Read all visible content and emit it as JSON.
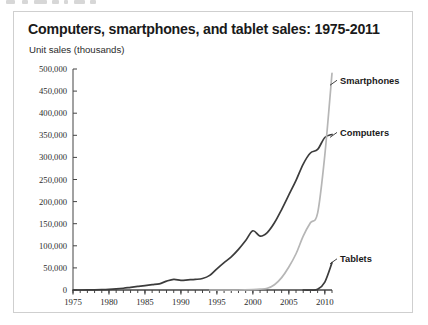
{
  "card": {
    "title": "Computers, smartphones, and tablet sales: 1975-2011",
    "y_axis_caption": "Unit sales (thousands)"
  },
  "chart_data": {
    "type": "line",
    "title": "Computers, smartphones, and tablet sales: 1975-2011",
    "subtitle": "Unit sales (thousands)",
    "xlabel": "",
    "ylabel": "Unit sales (thousands)",
    "xlim": [
      1975,
      2011
    ],
    "ylim": [
      0,
      500000
    ],
    "grid": false,
    "legend_position": "inline-right",
    "y_ticks": [
      0,
      50000,
      100000,
      150000,
      200000,
      250000,
      300000,
      350000,
      400000,
      450000,
      500000
    ],
    "y_tick_labels": [
      "0",
      "50,000",
      "100,000",
      "150,000",
      "200,000",
      "250,000",
      "300,000",
      "350,000",
      "400,000",
      "450,000",
      "500,000"
    ],
    "x_ticks": [
      1975,
      1980,
      1985,
      1990,
      1995,
      2000,
      2005,
      2010
    ],
    "x_tick_labels": [
      "1975",
      "1980",
      "1985",
      "1990",
      "1995",
      "2000",
      "2005",
      "2010"
    ],
    "x_minor_tick_interval": 1,
    "series": [
      {
        "name": "Computers",
        "color": "#3c3c3c",
        "label_x": 2011.3,
        "label_y": 352000,
        "x": [
          1975,
          1976,
          1977,
          1978,
          1979,
          1980,
          1981,
          1982,
          1983,
          1984,
          1985,
          1986,
          1987,
          1988,
          1989,
          1990,
          1991,
          1992,
          1993,
          1994,
          1995,
          1996,
          1997,
          1998,
          1999,
          2000,
          2001,
          2002,
          2003,
          2004,
          2005,
          2006,
          2007,
          2008,
          2009,
          2010,
          2011
        ],
        "values": [
          0,
          0,
          200,
          500,
          900,
          1500,
          2500,
          4000,
          6000,
          8000,
          10000,
          12000,
          14000,
          20000,
          24000,
          22000,
          23000,
          24000,
          26000,
          33000,
          48000,
          62000,
          75000,
          92000,
          112000,
          134000,
          122000,
          130000,
          152000,
          182000,
          215000,
          248000,
          285000,
          310000,
          318000,
          345000,
          352000
        ]
      },
      {
        "name": "Smartphones",
        "color": "#b6b6b6",
        "label_x": 2011.3,
        "label_y": 470000,
        "x": [
          1994,
          1996,
          1998,
          2000,
          2001,
          2002,
          2003,
          2004,
          2005,
          2006,
          2007,
          2008,
          2009,
          2010,
          2011
        ],
        "values": [
          0,
          0,
          0,
          1000,
          2000,
          4000,
          12000,
          28000,
          52000,
          82000,
          122000,
          152000,
          174000,
          305000,
          490000
        ]
      },
      {
        "name": "Tablets",
        "color": "#3c3c3c",
        "label_x": 2011.3,
        "label_y": 66000,
        "x": [
          2007,
          2008,
          2009,
          2010,
          2011
        ],
        "values": [
          0,
          0,
          1500,
          18000,
          62000
        ]
      }
    ]
  }
}
